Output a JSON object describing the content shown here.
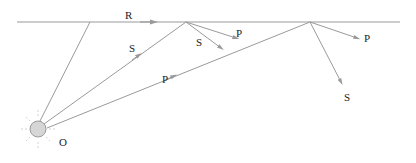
{
  "diagram": {
    "colors": {
      "line": "#9a9a9a",
      "source_fill": "#d6d6d6",
      "source_stroke": "#9a9a9a",
      "text": "#222222"
    },
    "labels": {
      "surface_wave": "R",
      "source": "O",
      "s_incident": "S",
      "p_incident": "P",
      "s_reflect_1": "S",
      "p_reflect_1": "P",
      "p_reflect_2": "P",
      "s_reflect_2": "S"
    }
  }
}
